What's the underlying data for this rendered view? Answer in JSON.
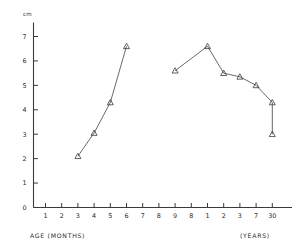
{
  "chart_data": {
    "type": "line",
    "title": "",
    "subtitle": "",
    "xlabel": "AGE (MONTHS)",
    "xlabel_right": "(YEARS)",
    "ylabel": "",
    "yunit": "cm",
    "ylim": [
      0,
      7.6
    ],
    "grid": false,
    "legend": "none",
    "y_ticks": [
      "0",
      "1",
      "2",
      "3",
      "4",
      "5",
      "6",
      "7"
    ],
    "y_tick_values": [
      0,
      1,
      2,
      3,
      4,
      5,
      6,
      7
    ],
    "x_ticks": [
      "1",
      "2",
      "3",
      "4",
      "5",
      "6",
      "7",
      "8",
      "9",
      "8",
      "1",
      "2",
      "3",
      "7",
      "30"
    ],
    "x_tick_units": [
      "months",
      "months",
      "months",
      "months",
      "months",
      "months",
      "months",
      "months",
      "months",
      "months",
      "years",
      "years",
      "years",
      "years",
      "years"
    ],
    "marker": "open-triangle",
    "series": [
      {
        "name": "infancy",
        "x": [
          "3",
          "4",
          "5",
          "6"
        ],
        "x_unit": "months",
        "values": [
          2.1,
          3.05,
          4.3,
          6.6
        ]
      },
      {
        "name": "childhood-adulthood",
        "x": [
          "9",
          "1",
          "2",
          "3",
          "7",
          "30"
        ],
        "x_unit": "mixed",
        "values": [
          5.6,
          6.6,
          5.5,
          5.35,
          5.0,
          4.3
        ]
      }
    ],
    "error_bars": [
      {
        "x": "30",
        "x_unit": "years",
        "value": 4.3,
        "low": 3.0,
        "high": 4.3
      }
    ],
    "annotations": []
  },
  "axes": {
    "y_unit_label": "cm",
    "x_title_left": "AGE (MONTHS)",
    "x_title_right": "(YEARS)"
  }
}
